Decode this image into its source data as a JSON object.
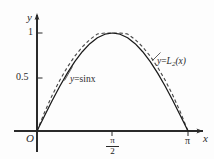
{
  "figure": {
    "axis_x_label": "x",
    "axis_y_label": "y",
    "origin_label": "O"
  },
  "annotations": {
    "sine_label_lhs": "y",
    "sine_label_eq": "=",
    "sine_label_rhs": "sinx",
    "poly_label_lhs": "y",
    "poly_label_eq": "=",
    "poly_label_L": "L",
    "poly_label_sub": "2",
    "poly_label_arg": "(x)"
  },
  "ticks": {
    "y_one": "1",
    "y_half": "0.5",
    "x_half_pi_num": "π",
    "x_half_pi_den": "2",
    "x_pi": "π"
  },
  "colors": {
    "ink": "#2a2a2a",
    "curve_solid": "#1a1a1a",
    "curve_dashed": "#4a4a4a",
    "background": "#fdfdfd"
  },
  "chart_data": {
    "type": "line",
    "title": "",
    "xlabel": "x",
    "ylabel": "y",
    "xlim": [
      -0.18,
      3.52
    ],
    "ylim": [
      -0.32,
      1.22
    ],
    "grid": false,
    "legend": "none",
    "xtick_values": [
      0,
      1.5708,
      3.1416
    ],
    "xtick_labels": [
      "O",
      "π/2",
      "π"
    ],
    "ytick_values": [
      0.5,
      1
    ],
    "ytick_labels": [
      "0.5",
      "1"
    ],
    "series": [
      {
        "name": "y=sinx",
        "style": "solid",
        "color": "#1a1a1a",
        "x": [
          0,
          0.1571,
          0.3142,
          0.4712,
          0.6283,
          0.7854,
          0.9425,
          1.0996,
          1.2566,
          1.4137,
          1.5708,
          1.7279,
          1.885,
          2.042,
          2.1991,
          2.3562,
          2.5133,
          2.6704,
          2.8274,
          2.9845,
          3.1416
        ],
        "y": [
          0,
          0.1564,
          0.309,
          0.454,
          0.5878,
          0.7071,
          0.809,
          0.891,
          0.9511,
          0.9877,
          1.0,
          0.9877,
          0.9511,
          0.891,
          0.809,
          0.7071,
          0.5878,
          0.454,
          0.309,
          0.1564,
          0
        ]
      },
      {
        "name": "y=L2(x)",
        "style": "dashed",
        "color": "#4a4a4a",
        "note": "quadratic interpolant of sin through (0,0), (pi/2,1), (pi,0)",
        "x": [
          0,
          0.1571,
          0.3142,
          0.4712,
          0.6283,
          0.7854,
          0.9425,
          1.0996,
          1.2566,
          1.4137,
          1.5708,
          1.7279,
          1.885,
          2.042,
          2.1991,
          2.3562,
          2.5133,
          2.6704,
          2.8274,
          2.9845,
          3.1416
        ],
        "y": [
          0,
          0.191,
          0.3628,
          0.5154,
          0.6488,
          0.7629,
          0.8578,
          0.9335,
          0.99,
          1.0,
          1.0,
          1.0,
          0.99,
          0.9335,
          0.8578,
          0.7629,
          0.6488,
          0.5154,
          0.3628,
          0.191,
          0
        ]
      }
    ],
    "annotations": [
      {
        "text": "y=sinx",
        "x": 1.05,
        "y": 0.58
      },
      {
        "text": "y=L2(x)",
        "x": 2.85,
        "y": 0.84
      }
    ]
  }
}
